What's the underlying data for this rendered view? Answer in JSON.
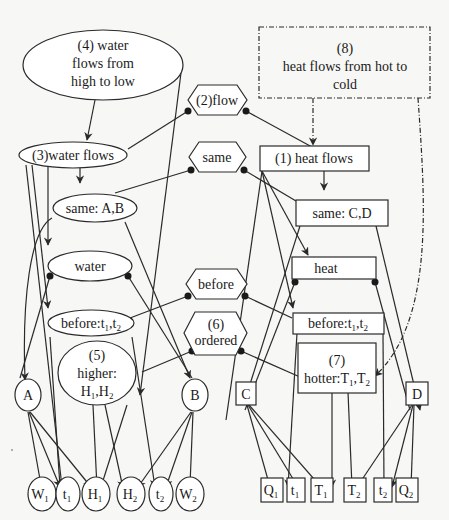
{
  "diagram": {
    "left_nodes": {
      "n4_line1": "(4)   water",
      "n4_line2": "flows from",
      "n4_line3": "high to low",
      "n3": "(3)water flows",
      "same_ab": "same: A,B",
      "water": "water",
      "before_left": "before:t",
      "n5_line1": "(5)",
      "n5_line2": "higher:",
      "n5_line3": "H",
      "A": "A",
      "B": "B",
      "leaves": [
        {
          "base": "W",
          "sub": "1"
        },
        {
          "base": "t",
          "sub": "1"
        },
        {
          "base": "H",
          "sub": "1"
        },
        {
          "base": "H",
          "sub": "2"
        },
        {
          "base": "t",
          "sub": "2"
        },
        {
          "base": "W",
          "sub": "2"
        }
      ]
    },
    "middle_nodes": {
      "flow": "(2)flow",
      "same": "same",
      "before": "before",
      "ordered_line1": "(6)",
      "ordered_line2": "ordered"
    },
    "right_nodes": {
      "n8_line1": "(8)",
      "n8_line2": "heat flows from hot to",
      "n8_line3": "cold",
      "n1": "(1)  heat flows",
      "same_cd": "same: C,D",
      "heat": "heat",
      "before_right": "before:t",
      "n7_line1": "(7)",
      "n7_line2": "hotter:T",
      "C": "C",
      "D": "D",
      "leaves": [
        {
          "base": "Q",
          "sub": "1"
        },
        {
          "base": "t",
          "sub": "1"
        },
        {
          "base": "T",
          "sub": "1"
        },
        {
          "base": "T",
          "sub": "2"
        },
        {
          "base": "t",
          "sub": "2"
        },
        {
          "base": "Q",
          "sub": "2"
        }
      ]
    },
    "subscripts": {
      "one": "1",
      "two": "2",
      "comma": ","
    },
    "colors": {
      "stroke": "#2a2a2a",
      "fill": "#ffffff",
      "background": "#f7f7f5"
    }
  }
}
